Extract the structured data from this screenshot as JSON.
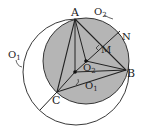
{
  "labels": {
    "A": "A",
    "B": "B",
    "C": "C",
    "M": "M",
    "N": "N",
    "O1_circle": "O",
    "O1_circle_sub": "1",
    "O2_circle": "O",
    "O2_circle_sub": "2",
    "O2_point": "O",
    "O2_point_sub": "2",
    "O1_point": "O",
    "O1_point_sub": "1"
  },
  "colors": {
    "stroke": "#222222",
    "shade": "#b5b5b5",
    "background": "#ffffff"
  },
  "points": {
    "A": [
      75,
      19
    ],
    "B": [
      126,
      70
    ],
    "C": [
      57,
      92
    ],
    "M": [
      102,
      48
    ],
    "N": [
      116,
      34
    ],
    "O1": [
      75,
      72
    ],
    "O2": [
      86,
      61
    ],
    "Cext": [
      40,
      110
    ]
  },
  "circles": {
    "O1": {
      "cx": 76,
      "cy": 72,
      "r": 53
    },
    "O2": {
      "cx": 86,
      "cy": 61,
      "r": 43
    }
  }
}
